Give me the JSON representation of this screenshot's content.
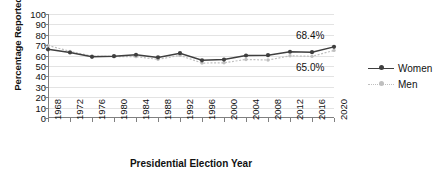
{
  "chart_data": {
    "type": "line",
    "title": "",
    "xlabel": "Presidential Election Year",
    "ylabel": "Percentage Reported Voting",
    "categories": [
      "1968",
      "1972",
      "1976",
      "1980",
      "1984",
      "1988",
      "1992",
      "1996",
      "2000",
      "2004",
      "2008",
      "2012",
      "2016",
      "2020"
    ],
    "ylim": [
      0,
      100
    ],
    "ytick_step": 10,
    "yticks": [
      "100",
      "90",
      "80",
      "70",
      "60",
      "50",
      "40",
      "30",
      "20",
      "10",
      "0"
    ],
    "grid": true,
    "legend_position": "right",
    "series": [
      {
        "name": "Women",
        "color": "#3f3f3f",
        "style": "solid",
        "marker": "circle",
        "values": [
          66.0,
          63.0,
          58.8,
          59.4,
          60.8,
          58.3,
          62.3,
          55.5,
          56.2,
          60.1,
          60.4,
          63.7,
          63.3,
          68.4
        ],
        "end_label": "68.4%"
      },
      {
        "name": "Men",
        "color": "#bfbfbf",
        "style": "dotted",
        "marker": "circle",
        "values": [
          69.8,
          64.1,
          59.6,
          59.1,
          59.0,
          56.4,
          60.2,
          52.8,
          53.1,
          56.3,
          55.7,
          59.8,
          59.3,
          65.0
        ],
        "end_label": "65.0%"
      }
    ],
    "annotations": [
      {
        "text": "68.4%",
        "series": "Women"
      },
      {
        "text": "65.0%",
        "series": "Men"
      }
    ]
  },
  "legend": {
    "items": [
      {
        "label": "Women"
      },
      {
        "label": "Men"
      }
    ]
  }
}
